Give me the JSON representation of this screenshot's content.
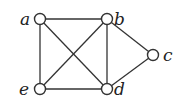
{
  "graph": {
    "nodes": [
      {
        "id": "a",
        "label": "a",
        "x": 40,
        "y": 19,
        "lx": 20,
        "ly": 25
      },
      {
        "id": "b",
        "label": "b",
        "x": 107,
        "y": 19,
        "lx": 114,
        "ly": 25
      },
      {
        "id": "c",
        "label": "c",
        "x": 153,
        "y": 55,
        "lx": 163,
        "ly": 61
      },
      {
        "id": "d",
        "label": "d",
        "x": 107,
        "y": 89,
        "lx": 114,
        "ly": 95
      },
      {
        "id": "e",
        "label": "e",
        "x": 40,
        "y": 89,
        "lx": 19,
        "ly": 95
      }
    ],
    "edges": [
      [
        "a",
        "b"
      ],
      [
        "a",
        "e"
      ],
      [
        "a",
        "d"
      ],
      [
        "b",
        "e"
      ],
      [
        "b",
        "d"
      ],
      [
        "b",
        "c"
      ],
      [
        "c",
        "d"
      ],
      [
        "e",
        "d"
      ]
    ],
    "colors": {
      "stroke": "#333333",
      "fill": "#ffffff"
    }
  }
}
